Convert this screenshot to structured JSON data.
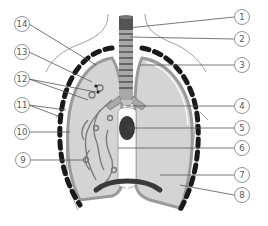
{
  "diagram": {
    "colors": {
      "lung_fill": "#d4d4d4",
      "lung_edge": "#9a9a9a",
      "trachea_dark": "#555555",
      "trachea_ring": "#a8a8a8",
      "heart_dark": "#3a3a3a",
      "rib_dark": "#1a1a1a",
      "diaphragm": "#3a3a3a",
      "body_outline": "#888888"
    },
    "labels_right": [
      {
        "id": "1",
        "text": "1"
      },
      {
        "id": "2",
        "text": "2"
      },
      {
        "id": "3",
        "text": "3"
      },
      {
        "id": "4",
        "text": "4"
      },
      {
        "id": "5",
        "text": "5"
      },
      {
        "id": "6",
        "text": "6"
      },
      {
        "id": "7",
        "text": "7"
      },
      {
        "id": "8",
        "text": "8"
      }
    ],
    "labels_left": [
      {
        "id": "14",
        "text": "14"
      },
      {
        "id": "13",
        "text": "13"
      },
      {
        "id": "12",
        "text": "12"
      },
      {
        "id": "11",
        "text": "11"
      },
      {
        "id": "10",
        "text": "10"
      },
      {
        "id": "9",
        "text": "9"
      }
    ]
  }
}
